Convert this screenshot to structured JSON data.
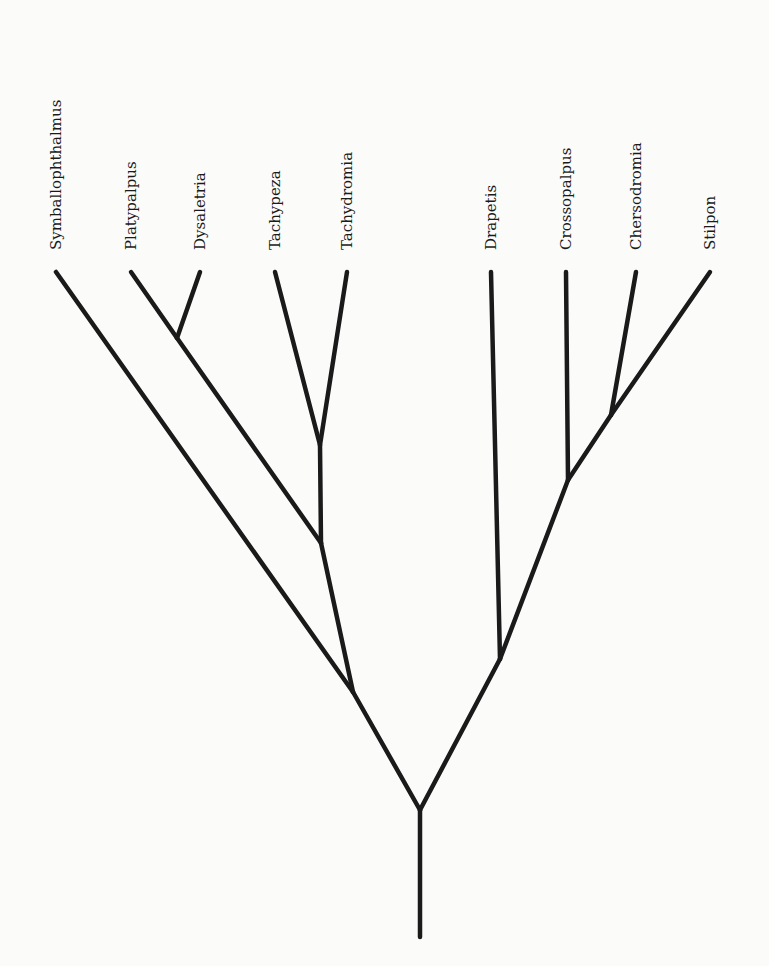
{
  "diagram": {
    "type": "cladogram",
    "taxa": [
      {
        "name": "Symballophthalmus",
        "x": 56,
        "y": 272
      },
      {
        "name": "Platypalpus",
        "x": 131,
        "y": 272
      },
      {
        "name": "Dysaletria",
        "x": 200,
        "y": 272
      },
      {
        "name": "Tachypeza",
        "x": 275,
        "y": 272
      },
      {
        "name": "Tachydromia",
        "x": 347,
        "y": 272
      },
      {
        "name": "Drapetis",
        "x": 491,
        "y": 272
      },
      {
        "name": "Crossopalpus",
        "x": 566,
        "y": 272
      },
      {
        "name": "Chersodromia",
        "x": 636,
        "y": 272
      },
      {
        "name": "Stilpon",
        "x": 710,
        "y": 272
      }
    ],
    "branches": [
      {
        "from": [
          420,
          937
        ],
        "to": [
          420,
          810
        ],
        "name": "root-stem"
      },
      {
        "from": [
          420,
          810
        ],
        "to": [
          353,
          692
        ],
        "name": "left-clade"
      },
      {
        "from": [
          420,
          810
        ],
        "to": [
          500,
          659
        ],
        "name": "right-clade"
      },
      {
        "from": [
          353,
          692
        ],
        "to": [
          56,
          272
        ],
        "name": "Symballophthalmus"
      },
      {
        "from": [
          353,
          692
        ],
        "to": [
          321,
          543
        ],
        "name": "inner-left"
      },
      {
        "from": [
          321,
          543
        ],
        "to": [
          177,
          338
        ],
        "name": "platy-dysal"
      },
      {
        "from": [
          177,
          338
        ],
        "to": [
          131,
          272
        ],
        "name": "Platypalpus"
      },
      {
        "from": [
          177,
          338
        ],
        "to": [
          200,
          272
        ],
        "name": "Dysaletria"
      },
      {
        "from": [
          321,
          543
        ],
        "to": [
          320,
          445
        ],
        "name": "tachy-stem"
      },
      {
        "from": [
          320,
          445
        ],
        "to": [
          275,
          272
        ],
        "name": "Tachypeza"
      },
      {
        "from": [
          320,
          445
        ],
        "to": [
          347,
          272
        ],
        "name": "Tachydromia"
      },
      {
        "from": [
          500,
          659
        ],
        "to": [
          491,
          272
        ],
        "name": "Drapetis"
      },
      {
        "from": [
          500,
          659
        ],
        "to": [
          568,
          480
        ],
        "name": "inner-right"
      },
      {
        "from": [
          568,
          480
        ],
        "to": [
          566,
          272
        ],
        "name": "Crossopalpus"
      },
      {
        "from": [
          568,
          480
        ],
        "to": [
          611,
          415
        ],
        "name": "chers-stil"
      },
      {
        "from": [
          611,
          415
        ],
        "to": [
          636,
          272
        ],
        "name": "Chersodromia"
      },
      {
        "from": [
          611,
          415
        ],
        "to": [
          710,
          272
        ],
        "name": "Stilpon"
      }
    ]
  }
}
